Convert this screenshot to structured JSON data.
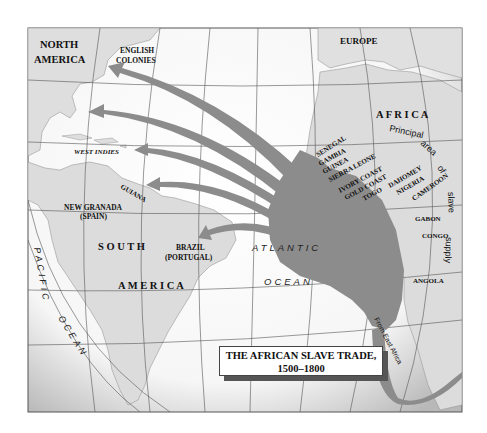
{
  "map": {
    "title_line1": "THE AFRICAN SLAVE TRADE,",
    "title_line2": "1500–1800",
    "continents": {
      "north_america_1": "NORTH",
      "north_america_2": "AMERICA",
      "europe": "EUROPE",
      "africa": "A F R I C A",
      "south_america_1": "S O U T H",
      "south_america_2": "A M E R I C A"
    },
    "regions": {
      "english_colonies_1": "ENGLISH",
      "english_colonies_2": "COLONIES",
      "west_indies": "WEST INDIES",
      "guiana": "GUIANA",
      "new_granada_1": "NEW GRANADA",
      "new_granada_2": "(SPAIN)",
      "brazil_1": "BRAZIL",
      "brazil_2": "(PORTUGAL)"
    },
    "african_coast": [
      "SENEGAL",
      "GAMBIA",
      "GUINEA",
      "SIERRA LEONE",
      "IVORY COAST",
      "GOLD COAST",
      "TOGO",
      "DAHOMEY",
      "NIGERIA",
      "CAMEROON",
      "GABON",
      "CONGO",
      "ANGOLA"
    ],
    "supply_label_1": "Principal",
    "supply_label_2": "area",
    "supply_label_3": "of",
    "supply_label_4": "slave",
    "supply_label_5": "supply",
    "oceans": {
      "atlantic_1": "ATLANTIC",
      "atlantic_2": "OCEAN",
      "pacific_1": "PACIFIC",
      "pacific_2": "OCEAN"
    },
    "from_east_africa": "From East Africa",
    "colors": {
      "land": "#dcdcdc",
      "sea": "#ffffff",
      "flow": "#8c8c8c",
      "grid": "#555555"
    }
  }
}
